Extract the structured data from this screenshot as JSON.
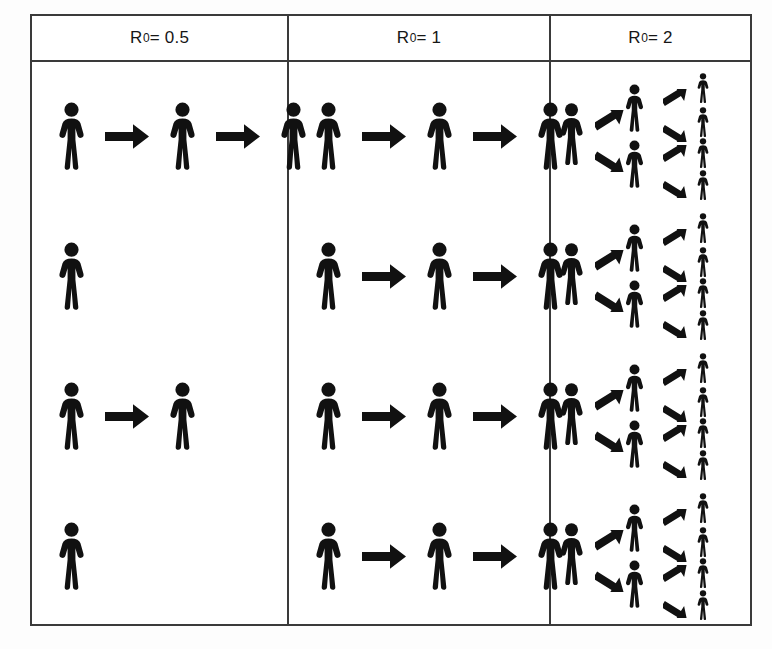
{
  "figure": {
    "ink_color": "#111111",
    "border_color": "#3a3a3a",
    "background_color": "#ffffff"
  },
  "columns": [
    {
      "id": "col-r0-0.5",
      "header_symbol": "R",
      "header_subscript": "0",
      "header_value": " = 0.5",
      "header_full": "R0 = 0.5",
      "r0": 0.5,
      "layout": "chain",
      "rows": [
        {
          "generations": 3,
          "arrows": 2
        },
        {
          "generations": 1,
          "arrows": 0
        },
        {
          "generations": 2,
          "arrows": 1
        },
        {
          "generations": 1,
          "arrows": 0
        }
      ]
    },
    {
      "id": "col-r0-1",
      "header_symbol": "R",
      "header_subscript": "0",
      "header_value": " = 1",
      "header_full": "R0 = 1",
      "r0": 1,
      "layout": "chain",
      "rows": [
        {
          "generations": 3,
          "arrows": 2
        },
        {
          "generations": 3,
          "arrows": 2
        },
        {
          "generations": 3,
          "arrows": 2
        },
        {
          "generations": 3,
          "arrows": 2
        }
      ]
    },
    {
      "id": "col-r0-2",
      "header_symbol": "R",
      "header_subscript": "0",
      "header_value": " = 2",
      "header_full": "R0 = 2",
      "r0": 2,
      "layout": "branching-tree",
      "rows": [
        {
          "gen0": 1,
          "gen1": 2,
          "gen2": 4,
          "arrows": 6
        },
        {
          "gen0": 1,
          "gen1": 2,
          "gen2": 4,
          "arrows": 6
        },
        {
          "gen0": 1,
          "gen1": 2,
          "gen2": 4,
          "arrows": 6
        },
        {
          "gen0": 1,
          "gen1": 2,
          "gen2": 4,
          "arrows": 6
        }
      ]
    }
  ],
  "chart_data": {
    "type": "diagram",
    "xlabel": "",
    "ylabel": "",
    "categories": [
      "R0 = 0.5",
      "R0 = 1",
      "R0 = 2"
    ],
    "series": [
      {
        "name": "R0 = 0.5",
        "description": "Sub-critical spread: chains die out; each row shows a different stochastic outcome",
        "rows_generation_counts": [
          [
            1,
            1,
            1
          ],
          [
            1
          ],
          [
            1,
            1
          ],
          [
            1
          ]
        ],
        "infected_per_row": [
          3,
          1,
          2,
          1
        ],
        "total_infected": 7
      },
      {
        "name": "R0 = 1",
        "description": "Critical spread: each case infects exactly one; chains persist at constant size",
        "rows_generation_counts": [
          [
            1,
            1,
            1
          ],
          [
            1,
            1,
            1
          ],
          [
            1,
            1,
            1
          ],
          [
            1,
            1,
            1
          ]
        ],
        "infected_per_row": [
          3,
          3,
          3,
          3
        ],
        "total_infected": 12
      },
      {
        "name": "R0 = 2",
        "description": "Super-critical spread: each case infects two; cases double every generation",
        "rows_generation_counts": [
          [
            1,
            2,
            4
          ],
          [
            1,
            2,
            4
          ],
          [
            1,
            2,
            4
          ],
          [
            1,
            2,
            4
          ]
        ],
        "infected_per_row": [
          7,
          7,
          7,
          7
        ],
        "total_infected": 28
      }
    ],
    "generations": [
      "Generation 0",
      "Generation 1",
      "Generation 2"
    ],
    "grid": false,
    "legend": "none"
  }
}
